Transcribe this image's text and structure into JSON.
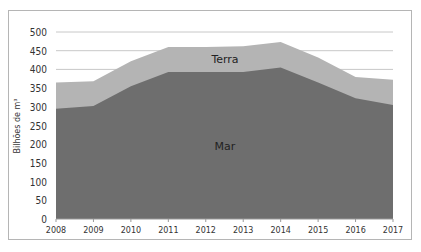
{
  "chart_data": {
    "type": "area",
    "stacked": true,
    "title": "",
    "xlabel": "",
    "ylabel": "Bilhões de m³",
    "categories": [
      "2008",
      "2009",
      "2010",
      "2011",
      "2012",
      "2013",
      "2014",
      "2015",
      "2016",
      "2017"
    ],
    "series": [
      {
        "name": "Mar",
        "color": "#6e6e6e",
        "values": [
          295,
          302,
          355,
          393,
          393,
          393,
          405,
          365,
          323,
          305
        ]
      },
      {
        "name": "Terra",
        "color": "#b4b4b4",
        "values": [
          70,
          66,
          67,
          67,
          67,
          69,
          68,
          67,
          57,
          67
        ]
      }
    ],
    "totals": [
      365,
      368,
      422,
      460,
      460,
      462,
      473,
      432,
      380,
      372
    ],
    "ylim": [
      0,
      500
    ],
    "yticks": [
      0,
      50,
      100,
      150,
      200,
      250,
      300,
      350,
      400,
      450,
      500
    ],
    "grid": true,
    "legend": "inline labels",
    "annotations": [
      {
        "text": "Terra",
        "x": "2012.5",
        "y": 430
      },
      {
        "text": "Mar",
        "x": "2012.5",
        "y": 190
      }
    ]
  }
}
